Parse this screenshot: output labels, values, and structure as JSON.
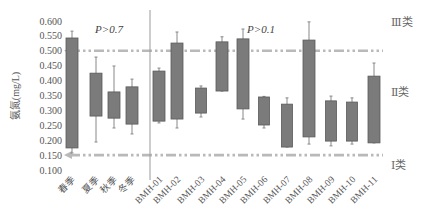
{
  "chart_data": {
    "type": "box",
    "title": "",
    "xlabel": "",
    "ylabel": "氨氮(mg/L)",
    "ylim": [
      0.1,
      0.6
    ],
    "yticks": [
      "0.600",
      "0.550",
      "0.500",
      "0.450",
      "0.400",
      "0.350",
      "0.300",
      "0.250",
      "0.200",
      "0.150",
      "0.100"
    ],
    "grid": false,
    "box_color": "#7b7b7b",
    "box_edge_color": "#5a5a5a",
    "whisker_color": "#888888",
    "reference_line_color": "#b9b9b9",
    "categories": [
      "春季",
      "夏季",
      "秋季",
      "冬季",
      "BMH-01",
      "BMH-02",
      "BMH-03",
      "BMH-04",
      "BMH-05",
      "BMH-06",
      "BMH-07",
      "BMH-08",
      "BMH-09",
      "BMH-10",
      "BMH-11"
    ],
    "groups": [
      {
        "name": "season",
        "members": [
          "春季",
          "夏季",
          "秋季",
          "冬季"
        ],
        "annotation": "P>0.7"
      },
      {
        "name": "site",
        "members": [
          "BMH-01",
          "BMH-02",
          "BMH-03",
          "BMH-04",
          "BMH-05",
          "BMH-06",
          "BMH-07",
          "BMH-08",
          "BMH-09",
          "BMH-10",
          "BMH-11"
        ],
        "annotation": "P>0.1"
      }
    ],
    "boxes": [
      {
        "label": "春季",
        "whisker_high": 0.566,
        "q3": 0.543,
        "q1": 0.174,
        "whisker_low": 0.157
      },
      {
        "label": "夏季",
        "whisker_high": 0.479,
        "q3": 0.425,
        "q1": 0.281,
        "whisker_low": 0.194
      },
      {
        "label": "秋季",
        "whisker_high": 0.449,
        "q3": 0.362,
        "q1": 0.274,
        "whisker_low": 0.241
      },
      {
        "label": "冬季",
        "whisker_high": 0.405,
        "q3": 0.379,
        "q1": 0.254,
        "whisker_low": 0.221
      },
      {
        "label": "BMH-01",
        "whisker_high": 0.442,
        "q3": 0.432,
        "q1": 0.264,
        "whisker_low": 0.258
      },
      {
        "label": "BMH-02",
        "whisker_high": 0.563,
        "q3": 0.526,
        "q1": 0.271,
        "whisker_low": 0.241
      },
      {
        "label": "BMH-03",
        "whisker_high": 0.382,
        "q3": 0.375,
        "q1": 0.291,
        "whisker_low": 0.278
      },
      {
        "label": "BMH-04",
        "whisker_high": 0.547,
        "q3": 0.53,
        "q1": 0.365,
        "whisker_low": 0.365
      },
      {
        "label": "BMH-05",
        "whisker_high": 0.573,
        "q3": 0.54,
        "q1": 0.305,
        "whisker_low": 0.271
      },
      {
        "label": "BMH-06",
        "whisker_high": 0.347,
        "q3": 0.345,
        "q1": 0.251,
        "whisker_low": 0.241
      },
      {
        "label": "BMH-07",
        "whisker_high": 0.342,
        "q3": 0.321,
        "q1": 0.177,
        "whisker_low": 0.177
      },
      {
        "label": "BMH-08",
        "whisker_high": 0.597,
        "q3": 0.536,
        "q1": 0.211,
        "whisker_low": 0.187
      },
      {
        "label": "BMH-09",
        "whisker_high": 0.348,
        "q3": 0.332,
        "q1": 0.197,
        "whisker_low": 0.181
      },
      {
        "label": "BMH-10",
        "whisker_high": 0.342,
        "q3": 0.328,
        "q1": 0.197,
        "whisker_low": 0.187
      },
      {
        "label": "BMH-11",
        "whisker_high": 0.459,
        "q3": 0.415,
        "q1": 0.191,
        "whisker_low": 0.191
      }
    ],
    "reference_lines": [
      {
        "value": 0.5,
        "style": "dash-dot",
        "arrow": "left"
      },
      {
        "value": 0.15,
        "style": "dash-dot",
        "arrow": "left"
      }
    ],
    "class_labels": [
      {
        "label": "Ⅲ类",
        "value": 0.595
      },
      {
        "label": "Ⅱ类",
        "value": 0.362
      },
      {
        "label": "Ⅰ类",
        "value": 0.118
      }
    ],
    "annotations": [
      "P>0.7",
      "P>0.1"
    ]
  }
}
